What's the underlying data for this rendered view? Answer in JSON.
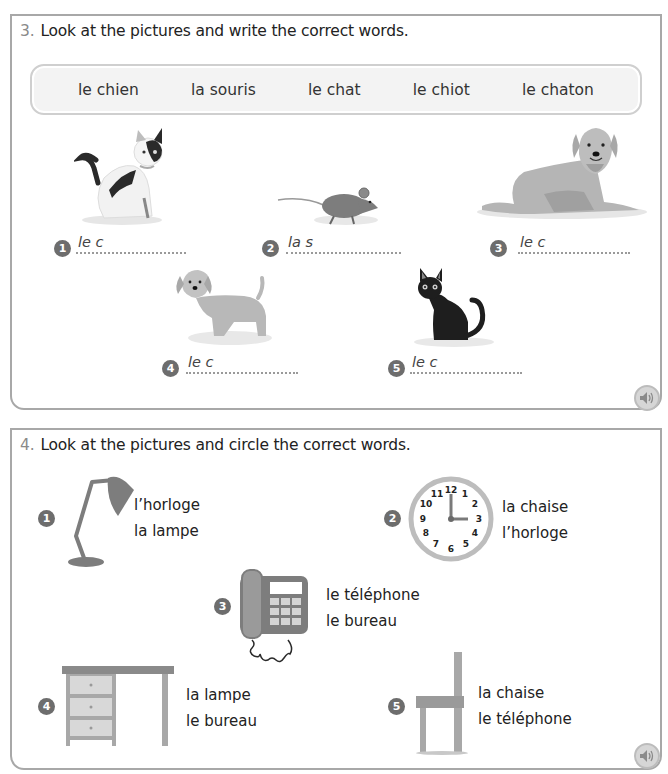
{
  "exercise3": {
    "number": "3.",
    "instruction": "Look at the pictures and write the correct words.",
    "word_bank": [
      "le chien",
      "la souris",
      "le chat",
      "le chiot",
      "le chaton"
    ],
    "items": [
      {
        "number": "1",
        "prompt": "le c",
        "picture": "white-black-cat"
      },
      {
        "number": "2",
        "prompt": "la s",
        "picture": "mouse"
      },
      {
        "number": "3",
        "prompt": "le c",
        "picture": "lying-dog"
      },
      {
        "number": "4",
        "prompt": "le c",
        "picture": "puppy"
      },
      {
        "number": "5",
        "prompt": "le c",
        "picture": "black-kitten"
      }
    ],
    "audio_icon": "speaker-icon"
  },
  "exercise4": {
    "number": "4.",
    "instruction": "Look at the pictures and circle the correct words.",
    "items": [
      {
        "number": "1",
        "picture": "desk-lamp",
        "options": [
          "l’horloge",
          "la lampe"
        ]
      },
      {
        "number": "2",
        "picture": "clock",
        "options": [
          "la chaise",
          "l’horloge"
        ]
      },
      {
        "number": "3",
        "picture": "telephone",
        "options": [
          "le téléphone",
          "le bureau"
        ]
      },
      {
        "number": "4",
        "picture": "desk",
        "options": [
          "la lampe",
          "le bureau"
        ]
      },
      {
        "number": "5",
        "picture": "chair",
        "options": [
          "la chaise",
          "le téléphone"
        ]
      }
    ],
    "clock_numbers": [
      "12",
      "1",
      "2",
      "3",
      "4",
      "5",
      "6",
      "7",
      "8",
      "9",
      "10",
      "11"
    ],
    "audio_icon": "speaker-icon"
  }
}
